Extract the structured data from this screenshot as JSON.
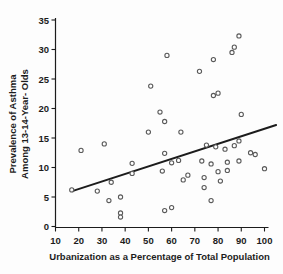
{
  "figure": {
    "background": "#fdfdfd",
    "axis_color": "#1c1c1c",
    "marker_color": "#5a5a5a",
    "trend_color": "#1c1c1c"
  },
  "chart_data": {
    "type": "scatter",
    "title": "",
    "xlabel": "Urbanization as a Percentage of Total Population",
    "ylabel_lines": [
      "Prevalence of Asthma",
      "Among 13-14-Year- Olds"
    ],
    "xlim": [
      10,
      100
    ],
    "ylim": [
      0,
      35
    ],
    "x_ticks": [
      10,
      20,
      30,
      40,
      50,
      60,
      70,
      80,
      90,
      100
    ],
    "y_ticks": [
      0,
      5,
      10,
      15,
      20,
      25,
      30,
      35
    ],
    "grid": false,
    "legend": null,
    "points": [
      [
        17,
        6.2
      ],
      [
        21,
        12.9
      ],
      [
        28,
        6.0
      ],
      [
        31,
        14.0
      ],
      [
        33,
        4.4
      ],
      [
        34,
        7.5
      ],
      [
        38,
        5.0
      ],
      [
        38,
        2.3
      ],
      [
        38,
        1.6
      ],
      [
        43,
        10.7
      ],
      [
        43,
        9.0
      ],
      [
        50,
        16.0
      ],
      [
        51,
        23.8
      ],
      [
        55,
        19.4
      ],
      [
        56,
        9.4
      ],
      [
        57,
        17.8
      ],
      [
        57,
        12.4
      ],
      [
        57,
        2.7
      ],
      [
        58,
        29.0
      ],
      [
        60,
        3.2
      ],
      [
        60,
        10.8
      ],
      [
        63,
        11.2
      ],
      [
        64,
        16.0
      ],
      [
        65,
        7.9
      ],
      [
        67,
        8.7
      ],
      [
        72,
        26.3
      ],
      [
        73,
        11.1
      ],
      [
        74,
        6.6
      ],
      [
        74,
        8.3
      ],
      [
        75,
        13.8
      ],
      [
        77,
        10.6
      ],
      [
        77,
        4.4
      ],
      [
        78,
        28.3
      ],
      [
        78,
        22.2
      ],
      [
        79,
        13.5
      ],
      [
        80,
        22.6
      ],
      [
        80,
        9.3
      ],
      [
        81,
        7.7
      ],
      [
        83,
        13.1
      ],
      [
        84,
        10.9
      ],
      [
        84,
        9.5
      ],
      [
        86,
        29.5
      ],
      [
        87,
        30.4
      ],
      [
        87,
        13.7
      ],
      [
        89,
        14.5
      ],
      [
        89,
        32.3
      ],
      [
        89,
        11.1
      ],
      [
        90,
        19.0
      ],
      [
        94,
        12.5
      ],
      [
        96,
        12.2
      ],
      [
        100,
        9.8
      ]
    ],
    "trend_line": {
      "start": [
        17.2,
        6.0
      ],
      "end": [
        105,
        17.2
      ]
    }
  }
}
